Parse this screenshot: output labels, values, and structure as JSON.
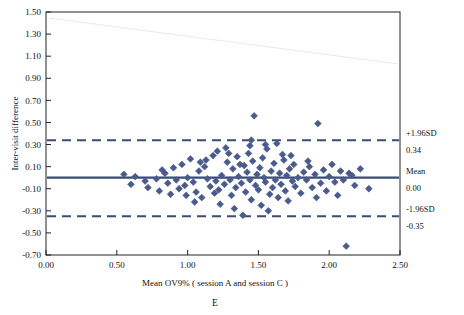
{
  "chart_data": {
    "type": "scatter",
    "title": "",
    "panel_letter": "E",
    "xlabel": "Mean OV9% ( session A and session C )",
    "ylabel": "Inter-visit difference",
    "xlim": [
      0.0,
      2.5
    ],
    "ylim": [
      -0.7,
      1.5
    ],
    "xticks": [
      "0.00",
      "0.50",
      "1.00",
      "1.50",
      "2.00",
      "2.50"
    ],
    "xtick_values": [
      0.0,
      0.5,
      1.0,
      1.5,
      2.0,
      2.5
    ],
    "yticks": [
      "1.50",
      "1.30",
      "1.10",
      "0.90",
      "0.70",
      "0.50",
      "0.30",
      "0.10",
      "-0.10",
      "-0.30",
      "-0.50",
      "-0.70"
    ],
    "ytick_values": [
      1.5,
      1.3,
      1.1,
      0.9,
      0.7,
      0.5,
      0.3,
      0.1,
      -0.1,
      -0.3,
      -0.5,
      -0.7
    ],
    "grid": false,
    "legend": "none",
    "marker_color": "#4a5a8c",
    "line_color": "#3a4a7a",
    "annotations": [
      {
        "name": "upper-loa-label",
        "text": "+1.96SD",
        "value": 0.34,
        "value_text": "0.34"
      },
      {
        "name": "mean-label",
        "text": "Mean",
        "value": 0.0,
        "value_text": "0.00"
      },
      {
        "name": "lower-loa-label",
        "text": "-1.96SD",
        "value": -0.35,
        "value_text": "-0.35"
      }
    ],
    "reference_lines": [
      {
        "name": "upper-limit-of-agreement",
        "y": 0.34,
        "style": "dashed"
      },
      {
        "name": "mean-line",
        "y": 0.0,
        "style": "solid"
      },
      {
        "name": "lower-limit-of-agreement",
        "y": -0.35,
        "style": "dashed"
      }
    ],
    "points": [
      [
        0.55,
        0.03
      ],
      [
        0.6,
        -0.06
      ],
      [
        0.63,
        0.01
      ],
      [
        0.7,
        -0.03
      ],
      [
        0.72,
        -0.09
      ],
      [
        0.78,
        -0.01
      ],
      [
        0.8,
        -0.12
      ],
      [
        0.84,
        0.04
      ],
      [
        0.86,
        -0.05
      ],
      [
        0.88,
        -0.15
      ],
      [
        0.9,
        0.09
      ],
      [
        0.92,
        -0.02
      ],
      [
        0.94,
        -0.1
      ],
      [
        0.96,
        0.12
      ],
      [
        0.98,
        -0.07
      ],
      [
        1.0,
        0.0
      ],
      [
        1.02,
        0.17
      ],
      [
        1.04,
        -0.04
      ],
      [
        1.06,
        -0.13
      ],
      [
        1.08,
        0.06
      ],
      [
        1.1,
        -0.18
      ],
      [
        1.12,
        0.1
      ],
      [
        1.14,
        -0.01
      ],
      [
        1.16,
        -0.08
      ],
      [
        1.18,
        0.2
      ],
      [
        1.2,
        -0.03
      ],
      [
        1.21,
        0.24
      ],
      [
        1.22,
        -0.11
      ],
      [
        1.24,
        0.02
      ],
      [
        1.26,
        -0.06
      ],
      [
        1.28,
        0.14
      ],
      [
        1.3,
        -0.02
      ],
      [
        1.31,
        -0.16
      ],
      [
        1.32,
        0.08
      ],
      [
        1.34,
        -0.09
      ],
      [
        1.35,
        0.19
      ],
      [
        1.36,
        0.01
      ],
      [
        1.38,
        -0.05
      ],
      [
        1.39,
        -0.34
      ],
      [
        1.4,
        0.11
      ],
      [
        1.41,
        -0.13
      ],
      [
        1.42,
        0.05
      ],
      [
        1.43,
        0.22
      ],
      [
        1.44,
        -0.02
      ],
      [
        1.45,
        -0.2
      ],
      [
        1.46,
        0.15
      ],
      [
        1.47,
        0.56
      ],
      [
        1.48,
        -0.07
      ],
      [
        1.49,
        0.03
      ],
      [
        1.5,
        -0.11
      ],
      [
        1.51,
        0.09
      ],
      [
        1.52,
        -0.25
      ],
      [
        1.53,
        0.18
      ],
      [
        1.54,
        0.0
      ],
      [
        1.55,
        -0.04
      ],
      [
        1.56,
        0.26
      ],
      [
        1.58,
        -0.15
      ],
      [
        1.59,
        0.06
      ],
      [
        1.6,
        -0.09
      ],
      [
        1.61,
        0.13
      ],
      [
        1.62,
        -0.02
      ],
      [
        1.63,
        0.31
      ],
      [
        1.64,
        -0.18
      ],
      [
        1.65,
        0.04
      ],
      [
        1.66,
        -0.06
      ],
      [
        1.68,
        0.16
      ],
      [
        1.69,
        -0.12
      ],
      [
        1.7,
        0.02
      ],
      [
        1.71,
        -0.21
      ],
      [
        1.72,
        0.08
      ],
      [
        1.74,
        -0.03
      ],
      [
        1.75,
        0.12
      ],
      [
        1.76,
        -0.08
      ],
      [
        1.78,
        0.0
      ],
      [
        1.8,
        -0.14
      ],
      [
        1.82,
        0.05
      ],
      [
        1.84,
        -0.02
      ],
      [
        1.86,
        0.1
      ],
      [
        1.88,
        -0.09
      ],
      [
        1.9,
        0.03
      ],
      [
        1.92,
        0.49
      ],
      [
        1.94,
        -0.05
      ],
      [
        1.96,
        0.07
      ],
      [
        1.98,
        -0.12
      ],
      [
        2.0,
        0.01
      ],
      [
        2.02,
        0.12
      ],
      [
        2.04,
        -0.04
      ],
      [
        2.06,
        -0.16
      ],
      [
        2.08,
        0.06
      ],
      [
        2.1,
        -0.02
      ],
      [
        2.12,
        -0.62
      ],
      [
        2.14,
        0.04
      ],
      [
        2.18,
        -0.07
      ],
      [
        2.22,
        0.08
      ],
      [
        2.28,
        -0.1
      ],
      [
        1.27,
        0.27
      ],
      [
        1.33,
        -0.28
      ],
      [
        1.44,
        0.29
      ],
      [
        1.57,
        -0.3
      ],
      [
        1.67,
        0.21
      ],
      [
        0.82,
        0.07
      ],
      [
        1.05,
        -0.22
      ],
      [
        1.13,
        0.16
      ],
      [
        1.23,
        -0.24
      ],
      [
        1.37,
        0.12
      ],
      [
        1.29,
        0.22
      ],
      [
        1.19,
        -0.14
      ],
      [
        1.09,
        0.14
      ],
      [
        0.99,
        -0.16
      ],
      [
        1.73,
        0.2
      ],
      [
        1.85,
        0.15
      ],
      [
        1.91,
        -0.18
      ],
      [
        2.16,
        0.02
      ],
      [
        1.45,
        0.34
      ],
      [
        1.55,
        0.3
      ]
    ]
  },
  "axis": {
    "ylabel_rotated": "Inter-visit difference"
  }
}
